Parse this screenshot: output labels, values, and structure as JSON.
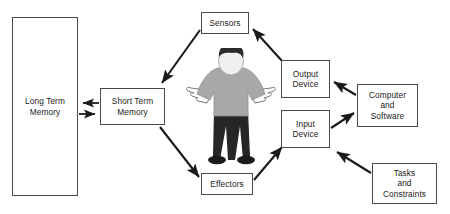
{
  "diagram": {
    "background_color": "#ffffff",
    "line_color": "#1a1a1a",
    "box_border_color": "#4a4a4a",
    "nodes": [
      {
        "id": "long-term-memory",
        "label": "Long Term\nMemory",
        "x": 12,
        "y": 17,
        "w": 66,
        "h": 179
      },
      {
        "id": "short-term-memory",
        "label": "Short Term\nMemory",
        "x": 100,
        "y": 88,
        "w": 65,
        "h": 37
      },
      {
        "id": "sensors",
        "label": "Sensors",
        "x": 201,
        "y": 12,
        "w": 48,
        "h": 22
      },
      {
        "id": "effectors",
        "label": "Effectors",
        "x": 201,
        "y": 173,
        "w": 52,
        "h": 22
      },
      {
        "id": "output-device",
        "label": "Output\nDevice",
        "x": 281,
        "y": 60,
        "w": 49,
        "h": 38
      },
      {
        "id": "input-device",
        "label": "Input\nDevice",
        "x": 281,
        "y": 110,
        "w": 49,
        "h": 38
      },
      {
        "id": "computer-and-software",
        "label": "Computer\nand\nSoftware",
        "x": 357,
        "y": 84,
        "w": 61,
        "h": 43
      },
      {
        "id": "tasks-and-constraints",
        "label": "Tasks\nand\nConstraints",
        "x": 372,
        "y": 163,
        "w": 65,
        "h": 41
      }
    ],
    "arrows": [
      {
        "id": "stm-to-ltm",
        "from": "short-term-memory",
        "to": "long-term-memory",
        "direction": "left"
      },
      {
        "id": "ltm-to-stm",
        "from": "long-term-memory",
        "to": "short-term-memory",
        "direction": "right"
      },
      {
        "id": "sensors-to-stm",
        "from": "sensors",
        "to": "short-term-memory",
        "direction": "down-left"
      },
      {
        "id": "stm-to-effectors",
        "from": "short-term-memory",
        "to": "effectors",
        "direction": "down-right"
      },
      {
        "id": "output-to-sensors",
        "from": "output-device",
        "to": "sensors",
        "direction": "up-left"
      },
      {
        "id": "effectors-to-input",
        "from": "effectors",
        "to": "input-device",
        "direction": "up-right"
      },
      {
        "id": "computer-to-output",
        "from": "computer-and-software",
        "to": "output-device",
        "direction": "up-left"
      },
      {
        "id": "input-to-computer",
        "from": "input-device",
        "to": "computer-and-software",
        "direction": "up-right"
      },
      {
        "id": "tasks-to-input",
        "from": "tasks-and-constraints",
        "to": "input-device",
        "direction": "up-left"
      }
    ],
    "figure": {
      "id": "person-figure",
      "description": "person-shrugging",
      "hair_color": "#2b2b2b",
      "face_color": "#f2f0ee",
      "shirt_color": "#a8a8a8",
      "pants_color": "#262626",
      "hand_color": "#ffffff",
      "outline_color": "#6b6b6b"
    }
  }
}
